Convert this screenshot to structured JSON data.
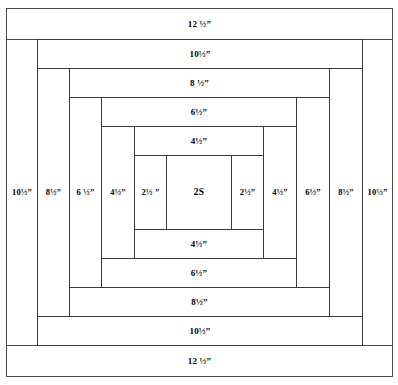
{
  "diagram": {
    "unit_symbol": "”",
    "center_label": "2S"
  },
  "rounds": [
    {
      "round": 5,
      "name": "outer-round",
      "top_label": "12 ½”",
      "bottom_label": "12 ½”",
      "left_label": "10½”",
      "right_label": "10½”"
    },
    {
      "round": 4,
      "name": "fourth-round",
      "top_label": "10½”",
      "bottom_label": "10½”",
      "left_label": "8½”",
      "right_label": "8½”"
    },
    {
      "round": 3,
      "name": "third-round",
      "top_label": "8 ½”",
      "bottom_label": "8½”",
      "left_label": "6 ½”",
      "right_label": "6½”"
    },
    {
      "round": 2,
      "name": "second-round",
      "top_label": "6½”",
      "bottom_label": "6½”",
      "left_label": "4½”",
      "right_label": "4½”"
    },
    {
      "round": 1,
      "name": "first-round",
      "top_label": "4½”",
      "bottom_label": "4½”",
      "left_label": "2½ ”",
      "right_label": "2½”"
    }
  ],
  "colors": {
    "line": "#3a3a3a",
    "fill": "#ffffff",
    "text": "#000000"
  }
}
